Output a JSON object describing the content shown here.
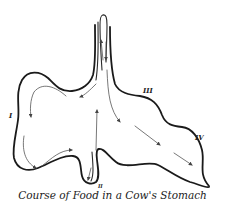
{
  "figure": {
    "caption": "Course of Food in a Cow's Stomach",
    "labels": {
      "compartment_1": "I",
      "compartment_2": "II",
      "compartment_3": "III",
      "compartment_4": "IV"
    },
    "colors": {
      "outline": "#1a1a1a",
      "arrows": "#555555",
      "text": "#222222",
      "background": "#ffffff"
    }
  }
}
